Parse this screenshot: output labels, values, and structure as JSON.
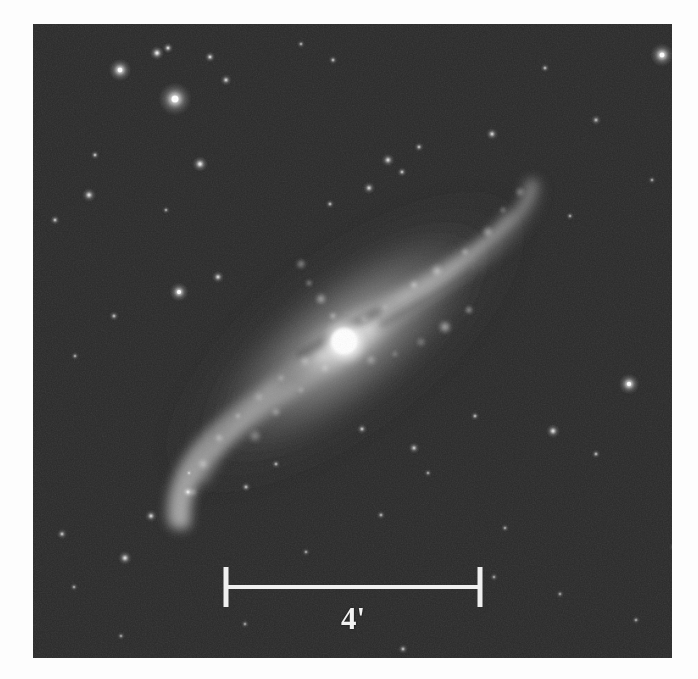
{
  "figure": {
    "domain": "astronomical-image",
    "background_color": "#2a2a2a",
    "page_background": "#fdfdfd",
    "frame": {
      "x": 33,
      "y": 24,
      "width": 639,
      "height": 634
    }
  },
  "scalebar": {
    "label": "4'",
    "unit_name": "arcminutes",
    "value": 4,
    "color": "#f0f0f0",
    "x_start": 193,
    "x_end": 447,
    "y_line": 563,
    "tick_half_height": 20,
    "line_thickness": 4,
    "tick_thickness": 5
  },
  "galaxy": {
    "name_displayed": "",
    "nucleus": {
      "x": 312,
      "y": 318,
      "radius": 17,
      "peak_color": "#ffffff"
    },
    "position_angle_deg": -38,
    "major_axis_length": 430,
    "minor_axis_length": 168,
    "disk_color": "#8f8f8f",
    "halo_color": "#555555",
    "bar": {
      "length": 150,
      "width": 46,
      "angle_deg": -30
    },
    "arms": [
      {
        "name": "northeast-arm",
        "points": [
          [
            312,
            318
          ],
          [
            360,
            285
          ],
          [
            415,
            252
          ],
          [
            462,
            222
          ],
          [
            492,
            196
          ],
          [
            500,
            172
          ]
        ],
        "brightness": 0.85
      },
      {
        "name": "southwest-arm",
        "points": [
          [
            312,
            318
          ],
          [
            262,
            352
          ],
          [
            214,
            386
          ],
          [
            176,
            420
          ],
          [
            152,
            458
          ],
          [
            146,
            492
          ]
        ],
        "brightness": 0.82
      }
    ],
    "hii_knots": [
      [
        352,
        283
      ],
      [
        381,
        261
      ],
      [
        404,
        247
      ],
      [
        432,
        228
      ],
      [
        455,
        208
      ],
      [
        470,
        186
      ],
      [
        487,
        168
      ],
      [
        331,
        295
      ],
      [
        300,
        292
      ],
      [
        288,
        275
      ],
      [
        276,
        259
      ],
      [
        268,
        240
      ],
      [
        272,
        337
      ],
      [
        248,
        354
      ],
      [
        226,
        373
      ],
      [
        205,
        392
      ],
      [
        186,
        414
      ],
      [
        170,
        440
      ],
      [
        160,
        468
      ],
      [
        338,
        336
      ],
      [
        362,
        330
      ],
      [
        388,
        318
      ],
      [
        412,
        303
      ],
      [
        436,
        286
      ],
      [
        292,
        344
      ],
      [
        268,
        366
      ],
      [
        243,
        388
      ],
      [
        222,
        412
      ]
    ]
  },
  "stars": [
    {
      "x": 87,
      "y": 46,
      "r": 5.4,
      "b": 1.0
    },
    {
      "x": 124,
      "y": 29,
      "r": 3.4,
      "b": 0.86
    },
    {
      "x": 135,
      "y": 24,
      "r": 2.6,
      "b": 0.72
    },
    {
      "x": 142,
      "y": 75,
      "r": 8.0,
      "b": 1.0
    },
    {
      "x": 177,
      "y": 33,
      "r": 2.6,
      "b": 0.7
    },
    {
      "x": 193,
      "y": 56,
      "r": 2.8,
      "b": 0.66
    },
    {
      "x": 167,
      "y": 140,
      "r": 3.8,
      "b": 0.82
    },
    {
      "x": 62,
      "y": 131,
      "r": 2.2,
      "b": 0.56
    },
    {
      "x": 56,
      "y": 171,
      "r": 3.4,
      "b": 0.74
    },
    {
      "x": 22,
      "y": 196,
      "r": 2.4,
      "b": 0.58
    },
    {
      "x": 300,
      "y": 36,
      "r": 2.2,
      "b": 0.52
    },
    {
      "x": 268,
      "y": 20,
      "r": 2.0,
      "b": 0.48
    },
    {
      "x": 512,
      "y": 44,
      "r": 2.2,
      "b": 0.5
    },
    {
      "x": 537,
      "y": 192,
      "r": 2.0,
      "b": 0.46
    },
    {
      "x": 629,
      "y": 31,
      "r": 5.6,
      "b": 0.98
    },
    {
      "x": 563,
      "y": 96,
      "r": 2.6,
      "b": 0.52
    },
    {
      "x": 619,
      "y": 156,
      "r": 2.0,
      "b": 0.44
    },
    {
      "x": 459,
      "y": 110,
      "r": 3.0,
      "b": 0.66
    },
    {
      "x": 386,
      "y": 123,
      "r": 2.4,
      "b": 0.55
    },
    {
      "x": 355,
      "y": 136,
      "r": 3.2,
      "b": 0.7
    },
    {
      "x": 369,
      "y": 148,
      "r": 2.4,
      "b": 0.56
    },
    {
      "x": 336,
      "y": 164,
      "r": 3.0,
      "b": 0.66
    },
    {
      "x": 297,
      "y": 180,
      "r": 2.2,
      "b": 0.52
    },
    {
      "x": 185,
      "y": 253,
      "r": 3.0,
      "b": 0.68
    },
    {
      "x": 146,
      "y": 268,
      "r": 4.6,
      "b": 0.9
    },
    {
      "x": 133,
      "y": 186,
      "r": 2.0,
      "b": 0.46
    },
    {
      "x": 81,
      "y": 292,
      "r": 2.4,
      "b": 0.52
    },
    {
      "x": 42,
      "y": 332,
      "r": 2.0,
      "b": 0.46
    },
    {
      "x": 596,
      "y": 360,
      "r": 5.0,
      "b": 0.95
    },
    {
      "x": 520,
      "y": 407,
      "r": 3.4,
      "b": 0.74
    },
    {
      "x": 563,
      "y": 430,
      "r": 2.2,
      "b": 0.5
    },
    {
      "x": 442,
      "y": 392,
      "r": 2.2,
      "b": 0.5
    },
    {
      "x": 329,
      "y": 405,
      "r": 2.6,
      "b": 0.56
    },
    {
      "x": 213,
      "y": 463,
      "r": 2.4,
      "b": 0.52
    },
    {
      "x": 155,
      "y": 468,
      "r": 3.4,
      "b": 0.74
    },
    {
      "x": 118,
      "y": 492,
      "r": 3.0,
      "b": 0.66
    },
    {
      "x": 29,
      "y": 510,
      "r": 2.6,
      "b": 0.56
    },
    {
      "x": 92,
      "y": 534,
      "r": 3.4,
      "b": 0.72
    },
    {
      "x": 41,
      "y": 563,
      "r": 2.0,
      "b": 0.46
    },
    {
      "x": 156,
      "y": 449,
      "r": 2.0,
      "b": 0.44
    },
    {
      "x": 243,
      "y": 440,
      "r": 2.2,
      "b": 0.48
    },
    {
      "x": 381,
      "y": 424,
      "r": 2.8,
      "b": 0.6
    },
    {
      "x": 395,
      "y": 449,
      "r": 2.0,
      "b": 0.44
    },
    {
      "x": 273,
      "y": 528,
      "r": 2.0,
      "b": 0.44
    },
    {
      "x": 348,
      "y": 491,
      "r": 2.2,
      "b": 0.48
    },
    {
      "x": 472,
      "y": 504,
      "r": 2.0,
      "b": 0.44
    },
    {
      "x": 641,
      "y": 523,
      "r": 2.2,
      "b": 0.48
    },
    {
      "x": 603,
      "y": 596,
      "r": 2.0,
      "b": 0.44
    },
    {
      "x": 370,
      "y": 625,
      "r": 2.4,
      "b": 0.52
    },
    {
      "x": 330,
      "y": 639,
      "r": 2.0,
      "b": 0.44
    },
    {
      "x": 212,
      "y": 600,
      "r": 2.0,
      "b": 0.42
    },
    {
      "x": 461,
      "y": 553,
      "r": 2.0,
      "b": 0.42
    },
    {
      "x": 527,
      "y": 570,
      "r": 2.0,
      "b": 0.42
    },
    {
      "x": 88,
      "y": 612,
      "r": 2.0,
      "b": 0.42
    }
  ]
}
